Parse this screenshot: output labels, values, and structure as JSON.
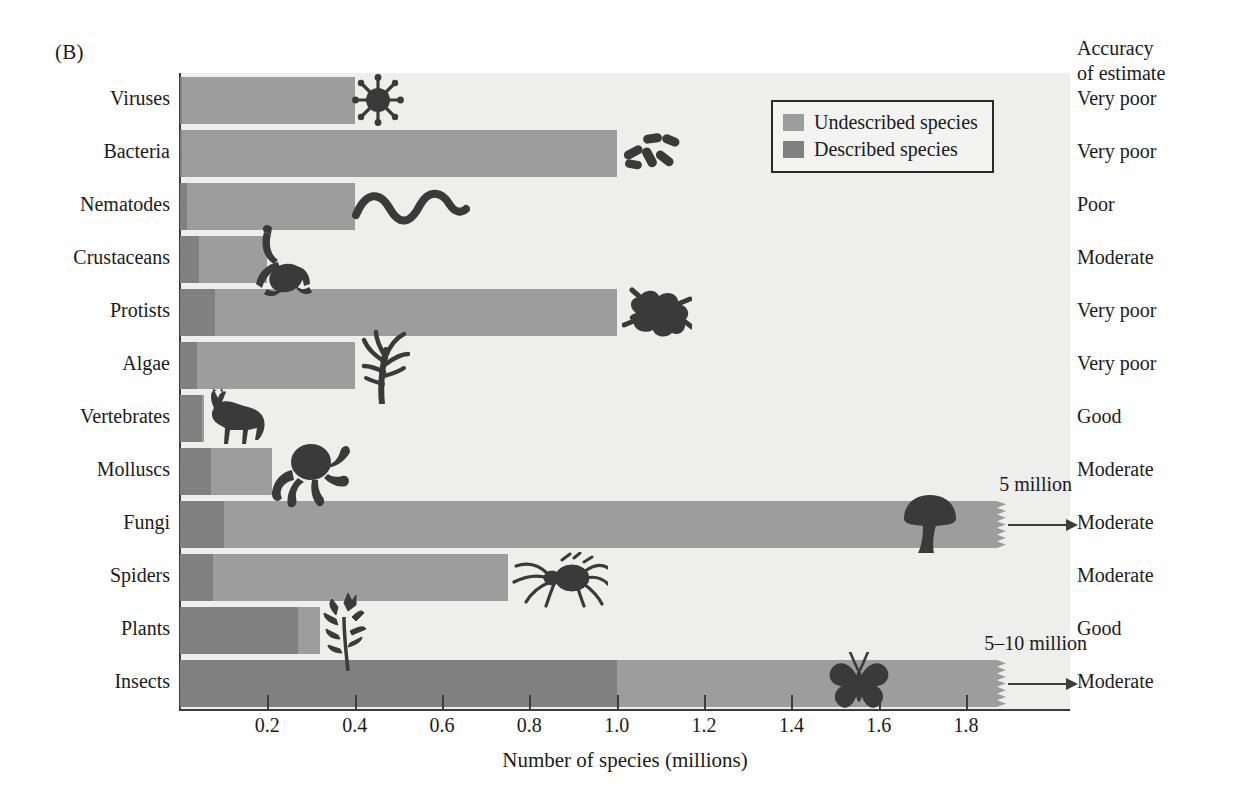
{
  "panel": {
    "letter": "(B)"
  },
  "accuracy": {
    "header": "Accuracy\nof estimate",
    "values": [
      "Very poor",
      "Very poor",
      "Poor",
      "Moderate",
      "Very poor",
      "Very poor",
      "Good",
      "Moderate",
      "Moderate",
      "Moderate",
      "Good",
      "Moderate"
    ]
  },
  "legend": {
    "position": "top-right-inside",
    "items": [
      {
        "label": "Undescribed species",
        "color": "#9d9d9d"
      },
      {
        "label": "Described species",
        "color": "#808080"
      }
    ]
  },
  "annotations": [
    {
      "category": "Fungi",
      "label": "5 million",
      "arrow": "right"
    },
    {
      "category": "Insects",
      "label": "5–10 million",
      "arrow": "right"
    }
  ],
  "colors": {
    "described": "#808080",
    "undescribed": "#9d9d9d",
    "plot_background": "#eeeeec",
    "axis": "#3d3d3d",
    "icon": "#3a3a3a",
    "text": "#1a1a1a"
  },
  "icons": [
    {
      "category": "Viruses",
      "name": "virus-icon"
    },
    {
      "category": "Bacteria",
      "name": "bacteria-icon"
    },
    {
      "category": "Nematodes",
      "name": "nematode-worm-icon"
    },
    {
      "category": "Crustaceans",
      "name": "crustacean-crab-icon"
    },
    {
      "category": "Protists",
      "name": "protist-amoeba-icon"
    },
    {
      "category": "Algae",
      "name": "algae-seaweed-icon"
    },
    {
      "category": "Vertebrates",
      "name": "vertebrate-horse-icon"
    },
    {
      "category": "Molluscs",
      "name": "mollusc-octopus-icon"
    },
    {
      "category": "Fungi",
      "name": "fungi-mushroom-icon"
    },
    {
      "category": "Spiders",
      "name": "spider-icon"
    },
    {
      "category": "Plants",
      "name": "plant-flower-icon"
    },
    {
      "category": "Insects",
      "name": "insect-butterfly-icon"
    }
  ],
  "chart_data": {
    "type": "bar",
    "orientation": "horizontal",
    "stacked": true,
    "title": "",
    "xlabel": "Number of species (millions)",
    "ylabel": "",
    "xlim": [
      0,
      2.04
    ],
    "xticks": [
      0.2,
      0.4,
      0.6,
      0.8,
      1.0,
      1.2,
      1.4,
      1.6,
      1.8
    ],
    "xticklabels": [
      "0.2",
      "0.4",
      "0.6",
      "0.8",
      "1.0",
      "1.2",
      "1.4",
      "1.6",
      "1.8"
    ],
    "grid": false,
    "legend": [
      "Undescribed species",
      "Described species"
    ],
    "categories": [
      "Viruses",
      "Bacteria",
      "Nematodes",
      "Crustaceans",
      "Protists",
      "Algae",
      "Vertebrates",
      "Molluscs",
      "Fungi",
      "Spiders",
      "Plants",
      "Insects"
    ],
    "series": [
      {
        "name": "Described species",
        "values": [
          0.005,
          0.005,
          0.015,
          0.044,
          0.08,
          0.04,
          0.05,
          0.07,
          0.1,
          0.075,
          0.27,
          1.0
        ]
      },
      {
        "name": "Undescribed species",
        "values": [
          0.395,
          0.995,
          0.385,
          0.156,
          0.92,
          0.36,
          0.005,
          0.14,
          1.77,
          0.675,
          0.05,
          0.87
        ]
      }
    ],
    "totals": [
      0.4,
      1.0,
      0.4,
      0.2,
      1.0,
      0.4,
      0.055,
      0.21,
      1.87,
      0.75,
      0.32,
      1.87
    ],
    "truncated_bars": [
      {
        "category": "Fungi",
        "true_value_label": "5 million"
      },
      {
        "category": "Insects",
        "true_value_label": "5–10 million"
      }
    ]
  }
}
